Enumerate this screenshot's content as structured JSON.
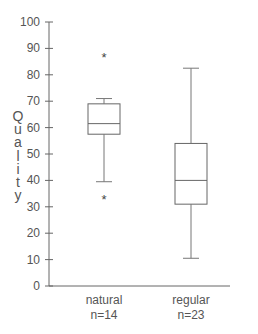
{
  "chart_data": {
    "type": "boxplot",
    "title": "",
    "xlabel": "",
    "ylabel": "Quality",
    "ylim": [
      0,
      100
    ],
    "yticks": [
      0,
      10,
      20,
      30,
      40,
      50,
      60,
      70,
      80,
      90,
      100
    ],
    "grid": false,
    "legend": null,
    "categories": [
      "natural",
      "regular"
    ],
    "sample_sizes": [
      "n=14",
      "n=23"
    ],
    "series": [
      {
        "name": "natural",
        "n_label": "n=14",
        "whisker_low": 39.5,
        "q1": 57.5,
        "median": 61.5,
        "q3": 69,
        "whisker_high": 71,
        "outliers": [
          88,
          34
        ]
      },
      {
        "name": "regular",
        "n_label": "n=23",
        "whisker_low": 10.5,
        "q1": 31,
        "median": 40,
        "q3": 54,
        "whisker_high": 82.5,
        "outliers": []
      }
    ]
  },
  "labels": {
    "ylabel_letters": [
      "Q",
      "u",
      "a",
      "l",
      "i",
      "t",
      "y"
    ],
    "outlier_marker": "*"
  }
}
